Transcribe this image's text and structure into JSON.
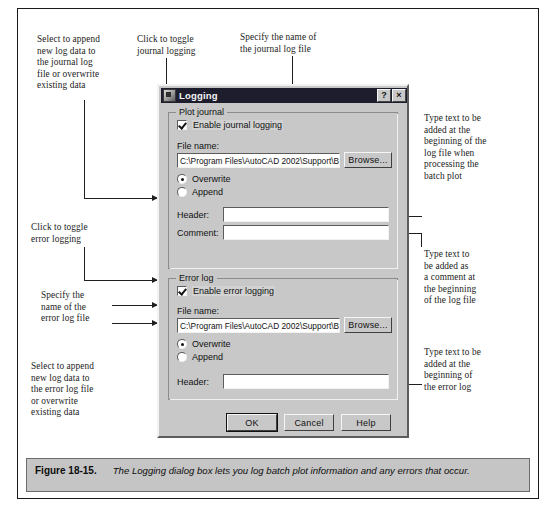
{
  "figure": {
    "number": "Figure 18-15.",
    "caption": "The Logging dialog box lets you log batch plot information and any errors that occur."
  },
  "annotations": [
    {
      "id": "append-journal",
      "text": "Select to append\nnew log data to\nthe journal log\nfile or overwrite\nexisting data"
    },
    {
      "id": "toggle-journal",
      "text": "Click to toggle\njournal logging"
    },
    {
      "id": "journal-name",
      "text": "Specify the name of\nthe journal log file"
    },
    {
      "id": "journal-header",
      "text": "Type text to be\nadded at the\nbeginning of the\nlog file when\nprocessing the\nbatch plot"
    },
    {
      "id": "journal-comment",
      "text": "Type text to\nbe added as\na comment at\nthe beginning\nof the log file"
    },
    {
      "id": "toggle-error",
      "text": "Click to toggle\nerror logging"
    },
    {
      "id": "error-name",
      "text": "Specify the\nname of the\nerror log file"
    },
    {
      "id": "append-error",
      "text": "Select to append\nnew log data to\nthe error log file\nor overwrite\nexisting data"
    },
    {
      "id": "error-header",
      "text": "Type text to be\nadded at the\nbeginning of\nthe error log"
    }
  ],
  "dialog": {
    "title": "Logging",
    "title_icon": "logging-app-icon",
    "help_button": "?",
    "close_button": "×",
    "plot_journal": {
      "group_label": "Plot journal",
      "enable_label": "Enable journal logging",
      "enable_checked": true,
      "file_name_label": "File name:",
      "file_name_value": "C:\\Program Files\\AutoCAD 2002\\Support\\Bat",
      "browse_label": "Browse...",
      "overwrite_label": "Overwrite",
      "append_label": "Append",
      "mode_selected": "Overwrite",
      "header_label": "Header:",
      "header_value": "",
      "comment_label": "Comment:",
      "comment_value": ""
    },
    "error_log": {
      "group_label": "Error log",
      "enable_label": "Enable error logging",
      "enable_checked": true,
      "file_name_label": "File name:",
      "file_name_value": "C:\\Program Files\\AutoCAD 2002\\Support\\Bat",
      "browse_label": "Browse...",
      "overwrite_label": "Overwrite",
      "append_label": "Append",
      "mode_selected": "Overwrite",
      "header_label": "Header:",
      "header_value": ""
    },
    "buttons": {
      "ok": "OK",
      "cancel": "Cancel",
      "help": "Help"
    }
  },
  "colors": {
    "dialog_face": "#c8c8c8",
    "titlebar": "#1d1d2e",
    "caption_bar": "#c5c5c5",
    "frame": "#1a1a1a"
  }
}
